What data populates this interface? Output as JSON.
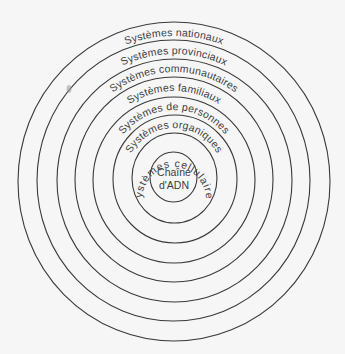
{
  "diagram": {
    "type": "concentric-circles",
    "background": "#f6f6f6",
    "stroke_color": "#3a3a3a",
    "text_color": "#3d3d3d",
    "rings": [
      {
        "label": "Systèmes nationaux"
      },
      {
        "label": "Systèmes provinciaux"
      },
      {
        "label": "Systèmes communautaires"
      },
      {
        "label": "Systèmes familiaux"
      },
      {
        "label": "Systèmes de personnes"
      },
      {
        "label": "Systèmes organiques"
      },
      {
        "label": "Systèmes cellulaires"
      }
    ],
    "center": {
      "line1": "Chaîne",
      "line2": "d'ADN"
    }
  }
}
